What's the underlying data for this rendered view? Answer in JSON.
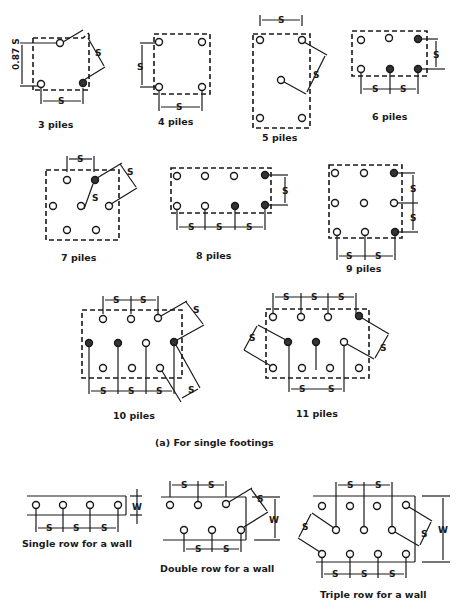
{
  "figure": {
    "section_a_caption": "(a) For single footings",
    "dimension_symbol": "S",
    "width_symbol": "W",
    "offset_label": "0.87 S"
  },
  "single_footings": [
    {
      "id": "3",
      "caption": "3 piles",
      "pile_count": 3
    },
    {
      "id": "4",
      "caption": "4 piles",
      "pile_count": 4
    },
    {
      "id": "5",
      "caption": "5 piles",
      "pile_count": 5
    },
    {
      "id": "6",
      "caption": "6 piles",
      "pile_count": 6
    },
    {
      "id": "7",
      "caption": "7 piles",
      "pile_count": 7
    },
    {
      "id": "8",
      "caption": "8 piles",
      "pile_count": 8
    },
    {
      "id": "9",
      "caption": "9 piles",
      "pile_count": 9
    },
    {
      "id": "10",
      "caption": "10 piles",
      "pile_count": 10
    },
    {
      "id": "11",
      "caption": "11 piles",
      "pile_count": 11
    }
  ],
  "wall_footings": [
    {
      "id": "single",
      "caption": "Single row for a wall",
      "pile_count": 4
    },
    {
      "id": "double",
      "caption": "Double row for a wall",
      "pile_count": 6
    },
    {
      "id": "triple",
      "caption": "Triple row for a wall",
      "pile_count": 11
    }
  ]
}
